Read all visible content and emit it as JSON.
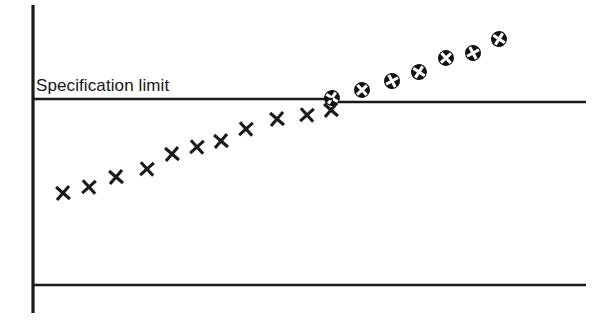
{
  "figure": {
    "background_color": "#ffffff",
    "ink_color": "#1a1a1a",
    "width": 612,
    "height": 334
  },
  "labels": {
    "spec_limit": "Specification limit"
  },
  "axes": {
    "y_axis": {
      "x": 33,
      "y_top": 5,
      "y_bottom": 313,
      "width": 3.2
    },
    "x_axis": {
      "y": 285,
      "x_left": 33,
      "x_right": 586,
      "width": 2.6
    },
    "spec_limit_line_left": {
      "y": 99,
      "x_left": 33,
      "x_right": 333,
      "width": 2.6
    },
    "spec_limit_line_right": {
      "y": 102,
      "x_left": 338,
      "x_right": 586,
      "width": 2.6
    }
  },
  "markers": {
    "in_spec_symbol": "x-mark",
    "out_of_spec_symbol": "circled-x-mark",
    "in_spec_count": 11,
    "out_of_spec_count": 7,
    "in_spec_size": 13,
    "out_of_spec_size": 16
  },
  "chart_data": {
    "type": "scatter",
    "title": "",
    "subtitle": "",
    "xlabel": "",
    "ylabel": "",
    "grid": false,
    "legend_position": "none",
    "annotations": [
      {
        "text": "Specification limit",
        "kind": "reference-line-label",
        "x": 36,
        "y": 86,
        "line_y_value": 0
      }
    ],
    "reference_lines": [
      {
        "name": "Specification limit",
        "y_value": 0,
        "orientation": "horizontal"
      }
    ],
    "xlim": [
      0,
      18
    ],
    "ylim": [
      -7.2,
      4.2
    ],
    "series": [
      {
        "name": "Within specification",
        "marker": "x-mark",
        "color": "#1a1a1a",
        "points": [
          {
            "i": 1,
            "px": 63,
            "py": 193,
            "x": 1,
            "y": -5.05
          },
          {
            "i": 2,
            "px": 89,
            "py": 187,
            "x": 2,
            "y": -4.73
          },
          {
            "i": 3,
            "px": 116,
            "py": 177,
            "x": 3,
            "y": -4.19
          },
          {
            "i": 4,
            "px": 147,
            "py": 169,
            "x": 4,
            "y": -3.76
          },
          {
            "i": 5,
            "px": 172,
            "py": 154,
            "x": 5,
            "y": -2.96
          },
          {
            "i": 6,
            "px": 197,
            "py": 147,
            "x": 6,
            "y": -2.58
          },
          {
            "i": 7,
            "px": 221,
            "py": 141,
            "x": 7,
            "y": -2.26
          },
          {
            "i": 8,
            "px": 246,
            "py": 129,
            "x": 8,
            "y": -1.61
          },
          {
            "i": 9,
            "px": 277,
            "py": 119,
            "x": 9,
            "y": -1.08
          },
          {
            "i": 10,
            "px": 307,
            "py": 115,
            "x": 10,
            "y": -0.86
          },
          {
            "i": 11,
            "px": 331,
            "py": 110,
            "x": 11,
            "y": -0.59
          }
        ]
      },
      {
        "name": "Beyond specification limit",
        "marker": "circled-x-mark",
        "color": "#1a1a1a",
        "points": [
          {
            "i": 12,
            "px": 332,
            "py": 98,
            "x": 12,
            "y": 0.05
          },
          {
            "i": 13,
            "px": 362,
            "py": 90,
            "x": 13,
            "y": 0.48
          },
          {
            "i": 14,
            "px": 392,
            "py": 81,
            "x": 14,
            "y": 0.97
          },
          {
            "i": 15,
            "px": 419,
            "py": 72,
            "x": 15,
            "y": 1.45
          },
          {
            "i": 16,
            "px": 446,
            "py": 58,
            "x": 16,
            "y": 2.2
          },
          {
            "i": 17,
            "px": 473,
            "py": 53,
            "x": 17,
            "y": 2.47
          },
          {
            "i": 18,
            "px": 499,
            "py": 39,
            "x": 18,
            "y": 3.23
          }
        ]
      }
    ]
  }
}
